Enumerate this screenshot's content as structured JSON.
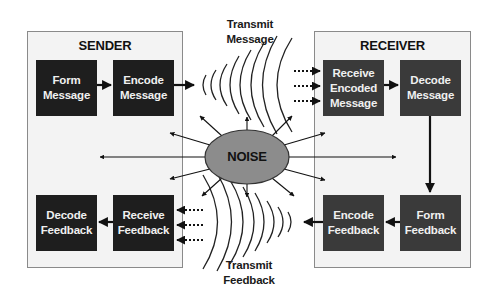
{
  "sender": {
    "title": "SENDER",
    "boxes": {
      "form_message": "Form Message",
      "encode_message": "Encode Message",
      "decode_feedback": "Decode Feedback",
      "receive_feedback": "Receive Feedback"
    }
  },
  "receiver": {
    "title": "RECEIVER",
    "boxes": {
      "receive_encoded_message": "Receive Encoded Message",
      "decode_message": "Decode Message",
      "encode_feedback": "Encode Feedback",
      "form_feedback": "Form Feedback"
    }
  },
  "channel": {
    "transmit_message": "Transmit Message",
    "transmit_feedback": "Transmit Feedback",
    "noise": "NOISE"
  },
  "colors": {
    "panel_bg": "#f3f3f3",
    "sender_box": "#1e1e1e",
    "receiver_box": "#3a3a3a",
    "noise_fill": "#8c8c8c",
    "line": "#111111"
  }
}
